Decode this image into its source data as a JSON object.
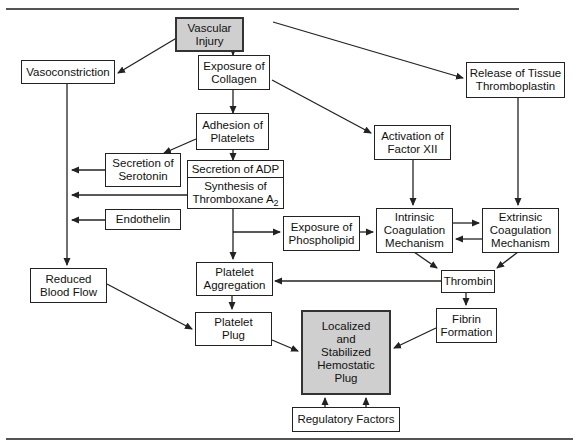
{
  "caption": "Figure — Summary of events leading to formation of a hemostatic plug after vascular injury",
  "colors": {
    "box_border": "#222222",
    "highlight_fill": "#cfcfcf",
    "line": "#222222",
    "rule": "#555555"
  },
  "nodes": {
    "vascular_injury": {
      "l1": "Vascular",
      "l2": "Injury"
    },
    "vasoconstriction": {
      "l1": "Vasoconstriction"
    },
    "exposure_collagen": {
      "l1": "Exposure of",
      "l2": "Collagen"
    },
    "release_tissue": {
      "l1": "Release of Tissue",
      "l2": "Thromboplastin"
    },
    "adhesion_platelets": {
      "l1": "Adhesion of",
      "l2": "Platelets"
    },
    "activation_factor": {
      "l1": "Activation of",
      "l2": "Factor XII"
    },
    "secretion_serotonin": {
      "l1": "Secretion of",
      "l2": "Serotonin"
    },
    "secretion_adp": {
      "top": "Secretion of ADP",
      "l1": "Synthesis of",
      "l2": "Thromboxane A",
      "sub": "2"
    },
    "endothelin": {
      "l1": "Endothelin"
    },
    "exposure_phospholipid": {
      "l1": "Exposure of",
      "l2": "Phospholipid"
    },
    "intrinsic": {
      "l1": "Intrinsic",
      "l2": "Coagulation",
      "l3": "Mechanism"
    },
    "extrinsic": {
      "l1": "Extrinsic",
      "l2": "Coagulation",
      "l3": "Mechanism"
    },
    "reduced_flow": {
      "l1": "Reduced",
      "l2": "Blood Flow"
    },
    "platelet_aggregation": {
      "l1": "Platelet",
      "l2": "Aggregation"
    },
    "thrombin": {
      "l1": "Thrombin"
    },
    "platelet_plug": {
      "l1": "Platelet",
      "l2": "Plug"
    },
    "fibrin_formation": {
      "l1": "Fibrin",
      "l2": "Formation"
    },
    "hemostatic_plug": {
      "l1": "Localized",
      "l2": "and",
      "l3": "Stabilized",
      "l4": "Hemostatic",
      "l5": "Plug"
    },
    "regulatory_factors": {
      "l1": "Regulatory Factors"
    }
  }
}
